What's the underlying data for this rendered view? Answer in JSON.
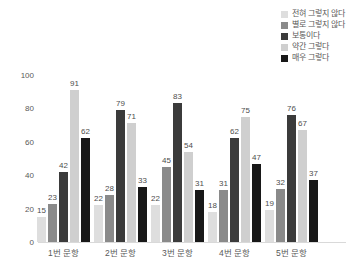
{
  "chart_data": {
    "type": "bar",
    "title": "",
    "categories": [
      "1번 문항",
      "2번 문항",
      "3번 문항",
      "4번 문항",
      "5번 문항"
    ],
    "series": [
      {
        "name": "전혀 그렇지 않다",
        "color": "#dedede",
        "values": [
          15,
          22,
          22,
          18,
          19
        ]
      },
      {
        "name": "별로 그렇지 않다",
        "color": "#8a8a8a",
        "values": [
          23,
          28,
          45,
          31,
          32
        ]
      },
      {
        "name": "보통이다",
        "color": "#3b3b3b",
        "values": [
          42,
          79,
          83,
          62,
          76
        ]
      },
      {
        "name": "약간 그렇다",
        "color": "#cfcfcf",
        "values": [
          91,
          71,
          54,
          75,
          67
        ]
      },
      {
        "name": "매우 그렇다",
        "color": "#181818",
        "values": [
          62,
          33,
          31,
          47,
          37
        ]
      }
    ],
    "xlabel": "",
    "ylabel": "",
    "ylim": [
      0,
      100
    ],
    "yticks": [
      0,
      20,
      40,
      60,
      80,
      100
    ],
    "grid": false,
    "legend_position": "top-right",
    "data_labels": true,
    "axis_color": "#d9d9d9",
    "tick_label_color": "#595959",
    "data_label_color": "#4d4d4d",
    "background_color": "#ffffff"
  }
}
